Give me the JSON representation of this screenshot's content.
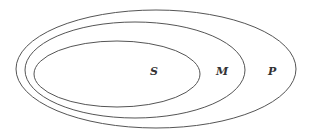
{
  "diagram": {
    "type": "nested-ellipses",
    "sets": [
      {
        "label": "P",
        "cx": 156,
        "cy": 69,
        "rx": 140,
        "ry": 59
      },
      {
        "label": "M",
        "cx": 135,
        "cy": 70,
        "rx": 110,
        "ry": 48
      },
      {
        "label": "S",
        "cx": 117,
        "cy": 74,
        "rx": 83,
        "ry": 33
      }
    ],
    "labels": {
      "S": "S",
      "M": "M",
      "P": "P"
    },
    "stroke_color": "#555555",
    "label_color": "#333333"
  }
}
